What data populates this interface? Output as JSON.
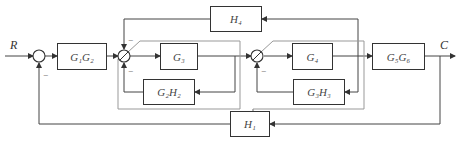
{
  "diagram": {
    "type": "block-diagram",
    "input_label": "R",
    "output_label": "C",
    "blocks": [
      {
        "id": "g1g2",
        "label": "G₁G₂"
      },
      {
        "id": "g3",
        "label": "G₃"
      },
      {
        "id": "g2h2",
        "label": "G₂H₂"
      },
      {
        "id": "h4",
        "label": "H₄"
      },
      {
        "id": "g4",
        "label": "G₄"
      },
      {
        "id": "g3h3",
        "label": "G₃H₃"
      },
      {
        "id": "g5g6",
        "label": "G₅G₆"
      },
      {
        "id": "h1",
        "label": "H₁"
      }
    ],
    "sign": "−"
  }
}
